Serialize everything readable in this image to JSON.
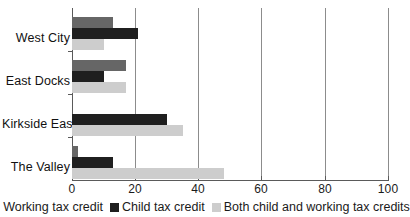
{
  "chart_data": {
    "type": "bar",
    "orientation": "horizontal",
    "title": "",
    "xlabel": "",
    "ylabel": "",
    "categories": [
      "West City",
      "East Docks",
      "Kirkside East",
      "The Valley"
    ],
    "series": [
      {
        "name": "Working  tax credit",
        "color": "#666666",
        "values": [
          13,
          17,
          0,
          2
        ]
      },
      {
        "name": "Child tax credit",
        "color": "#1f1f1f",
        "values": [
          21,
          10,
          30,
          13
        ]
      },
      {
        "name": "Both child and working tax credits",
        "color": "#cdcdcd",
        "values": [
          10,
          17,
          35,
          48
        ]
      }
    ],
    "xlim": [
      0,
      100
    ],
    "xticks": [
      0,
      20,
      40,
      60,
      80,
      100
    ],
    "xtick_labels": [
      "0",
      "20",
      "40",
      "60",
      "80",
      "100"
    ],
    "grid": "vertical",
    "legend_position": "bottom"
  },
  "axis": {
    "ticks": [
      {
        "value": 0,
        "label": "0"
      },
      {
        "value": 20,
        "label": "20"
      },
      {
        "value": 40,
        "label": "40"
      },
      {
        "value": 60,
        "label": "60"
      },
      {
        "value": 80,
        "label": "80"
      },
      {
        "value": 100,
        "label": "100"
      }
    ]
  },
  "categories": [
    {
      "label": "West City"
    },
    {
      "label": "East Docks"
    },
    {
      "label": "Kirkside East"
    },
    {
      "label": "The Valley"
    }
  ],
  "legend": {
    "items": [
      {
        "label": "Working  tax credit",
        "color": "#666666"
      },
      {
        "label": "Child tax credit",
        "color": "#1f1f1f"
      },
      {
        "label": "Both child and working tax credits",
        "color": "#cdcdcd"
      }
    ]
  }
}
